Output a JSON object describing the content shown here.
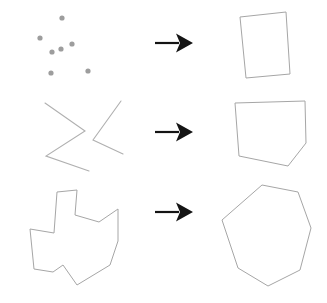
{
  "figure": {
    "background_color": "#ffffff",
    "width": 327,
    "height": 303,
    "shape_stroke_color": "#a6a6a6",
    "point_color": "#9d9d9d",
    "arrow_color": "#141414",
    "rows": [
      {
        "id": "row-1",
        "input_label": "point set",
        "output_label": "quadrilateral hull",
        "arrow_label": "maps to"
      },
      {
        "id": "row-2",
        "input_label": "open polyline zigzag",
        "output_label": "pentagon hull",
        "arrow_label": "maps to"
      },
      {
        "id": "row-3",
        "input_label": "concave polygon",
        "output_label": "heptagon hull",
        "arrow_label": "maps to"
      }
    ]
  },
  "chart_data": {
    "type": "scatter",
    "xlabel": "",
    "ylabel": "",
    "xlim": [
      0,
      327
    ],
    "ylim": [
      0,
      303
    ],
    "grid": false,
    "legend": "none",
    "annotations": [
      "row 1: scattered points to convex quadrilateral",
      "row 2: open zigzag polyline to convex pentagon",
      "row 3: concave star-like polygon to convex heptagon"
    ],
    "series": [
      {
        "name": "row1-input-points",
        "type": "scatter",
        "radius": 2.6,
        "color": "#9d9d9d",
        "points": [
          [
            40,
            38
          ],
          [
            62,
            18
          ],
          [
            52,
            52
          ],
          [
            61,
            49
          ],
          [
            72,
            44
          ],
          [
            51,
            73
          ],
          [
            88,
            71
          ]
        ]
      },
      {
        "name": "row1-output-hull",
        "type": "polygon",
        "closed": true,
        "color": "#a6a6a6",
        "points": [
          [
            240,
            17
          ],
          [
            286,
            12
          ],
          [
            290,
            74
          ],
          [
            246,
            78
          ]
        ]
      },
      {
        "name": "row2-input-polyline-a",
        "type": "polyline",
        "closed": false,
        "color": "#b0b0b0",
        "points": [
          [
            45,
            103
          ],
          [
            85,
            131
          ],
          [
            46,
            156
          ],
          [
            89,
            171
          ]
        ]
      },
      {
        "name": "row2-input-polyline-b",
        "type": "polyline",
        "closed": false,
        "color": "#b0b0b0",
        "points": [
          [
            121,
            101
          ],
          [
            93,
            140
          ],
          [
            123,
            154
          ]
        ]
      },
      {
        "name": "row2-output-hull",
        "type": "polygon",
        "closed": true,
        "color": "#a6a6a6",
        "points": [
          [
            235,
            103
          ],
          [
            305,
            101
          ],
          [
            306,
            143
          ],
          [
            288,
            166
          ],
          [
            239,
            156
          ]
        ]
      },
      {
        "name": "row3-input-concave-polygon",
        "type": "polygon",
        "closed": true,
        "color": "#a6a6a6",
        "points": [
          [
            57,
            192
          ],
          [
            77,
            190
          ],
          [
            75,
            215
          ],
          [
            99,
            222
          ],
          [
            118,
            209
          ],
          [
            118,
            241
          ],
          [
            110,
            265
          ],
          [
            77,
            285
          ],
          [
            63,
            265
          ],
          [
            53,
            272
          ],
          [
            34,
            269
          ],
          [
            30,
            229
          ],
          [
            54,
            233
          ]
        ]
      },
      {
        "name": "row3-output-hull",
        "type": "polygon",
        "closed": true,
        "color": "#a6a6a6",
        "points": [
          [
            262,
            185
          ],
          [
            298,
            192
          ],
          [
            311,
            228
          ],
          [
            300,
            270
          ],
          [
            268,
            286
          ],
          [
            238,
            268
          ],
          [
            222,
            220
          ]
        ]
      }
    ],
    "arrows": [
      {
        "name": "row1-arrow",
        "from": [
          155,
          43
        ],
        "to": [
          193,
          43
        ],
        "color": "#141414"
      },
      {
        "name": "row2-arrow",
        "from": [
          155,
          132
        ],
        "to": [
          193,
          132
        ],
        "color": "#141414"
      },
      {
        "name": "row3-arrow",
        "from": [
          155,
          212
        ],
        "to": [
          193,
          212
        ],
        "color": "#141414"
      }
    ]
  }
}
